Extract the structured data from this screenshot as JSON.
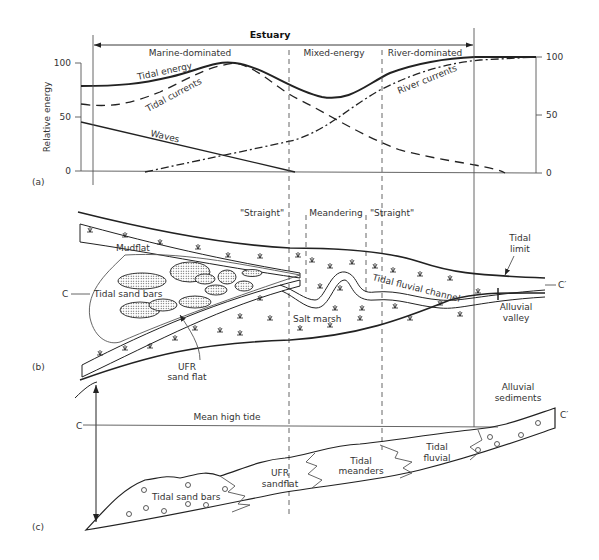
{
  "diagram": {
    "panel_a": {
      "label": "(a)",
      "header": "Estuary",
      "zones": [
        "Marine-dominated",
        "Mixed-energy",
        "River-dominated"
      ],
      "y_axis_label": "Relative energy",
      "y_ticks_left": [
        "100",
        "50",
        "0"
      ],
      "y_ticks_right": [
        "100",
        "50",
        "0"
      ],
      "curves": {
        "tidal_energy": "Tidal energy",
        "tidal_currents": "Tidal currents",
        "waves": "Waves",
        "river_currents": "River currents"
      }
    },
    "panel_b": {
      "label": "(b)",
      "zones": [
        "\"Straight\"",
        "Meandering",
        "\"Straight\""
      ],
      "labels": {
        "mudflat": "Mudflat",
        "tidal_sand_bars": "Tidal sand bars",
        "ufr_sand_flat_1": "UFR",
        "ufr_sand_flat_2": "sand flat",
        "salt_marsh": "Salt marsh",
        "tidal_fluvial_channel": "Tidal fluvial channel",
        "tidal_limit_1": "Tidal",
        "tidal_limit_2": "limit",
        "alluvial_valley_1": "Alluvial",
        "alluvial_valley_2": "valley",
        "section_start": "C",
        "section_end": "C′"
      }
    },
    "panel_c": {
      "label": "(c)",
      "labels": {
        "mean_high_tide": "Mean high tide",
        "alluvial_sediments_1": "Alluvial",
        "alluvial_sediments_2": "sediments",
        "tidal_sand_bars": "Tidal sand bars",
        "ufr_sandflat_1": "UFR",
        "ufr_sandflat_2": "sandflat",
        "tidal_meanders_1": "Tidal",
        "tidal_meanders_2": "meanders",
        "tidal_fluvial_1": "Tidal",
        "tidal_fluvial_2": "fluvial",
        "section_start": "C",
        "section_end": "C′"
      }
    }
  }
}
